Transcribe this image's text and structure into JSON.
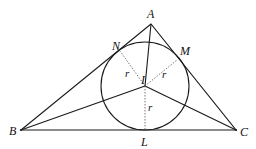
{
  "diagram": {
    "type": "geometry",
    "colors": {
      "stroke": "#1a1a1a",
      "dotted": "#555555",
      "background": "#ffffff"
    },
    "points": {
      "A": {
        "label": "A",
        "x": 151,
        "y": 24
      },
      "B": {
        "label": "B",
        "x": 21,
        "y": 130
      },
      "C": {
        "label": "C",
        "x": 236,
        "y": 130
      },
      "I": {
        "label": "I",
        "x": 145,
        "y": 86
      },
      "L": {
        "label": "L",
        "x": 145,
        "y": 130
      },
      "M": {
        "label": "M",
        "x": 176,
        "y": 58
      },
      "N": {
        "label": "N",
        "x": 123,
        "y": 45
      }
    },
    "incircle": {
      "center": "I",
      "radius": 44
    },
    "segments_solid": [
      "AB",
      "BC",
      "CA",
      "AI",
      "BI",
      "CI"
    ],
    "segments_dotted": [
      "IN",
      "IM",
      "IL"
    ],
    "radius_labels": [
      {
        "label": "r",
        "near": "IN"
      },
      {
        "label": "r",
        "near": "IM"
      },
      {
        "label": "r",
        "near": "IL"
      }
    ]
  }
}
